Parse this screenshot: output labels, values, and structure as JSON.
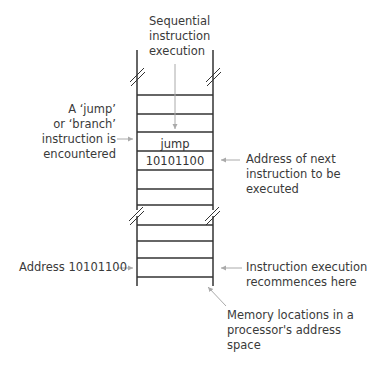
{
  "diagram": {
    "colors": {
      "rail": "#333333",
      "arrow": "#aaaaaa",
      "text": "#3a3a3a"
    },
    "labels": {
      "top": {
        "lines": [
          "Sequential",
          "instruction",
          "execution"
        ]
      },
      "jump_encountered": {
        "lines": [
          "A ‘jump’",
          "or ‘branch’",
          "instruction is",
          "encountered"
        ]
      },
      "next_address": {
        "lines": [
          "Address of next",
          "instruction to be",
          "executed"
        ]
      },
      "target_address": {
        "text": "Address 10101100"
      },
      "recommence": {
        "lines": [
          "Instruction execution",
          "recommences here"
        ]
      },
      "memory_locations": {
        "lines": [
          "Memory locations in a",
          "processor's address",
          "space"
        ]
      }
    },
    "cells": {
      "jump": "jump",
      "address": "10101100"
    },
    "upper_ladder": {
      "rail_left_x": 137,
      "rail_right_x": 213,
      "rungs_y": [
        95,
        114,
        132,
        151,
        170,
        189,
        205
      ]
    },
    "lower_ladder": {
      "rungs_y": [
        225,
        241,
        258,
        277
      ]
    }
  }
}
